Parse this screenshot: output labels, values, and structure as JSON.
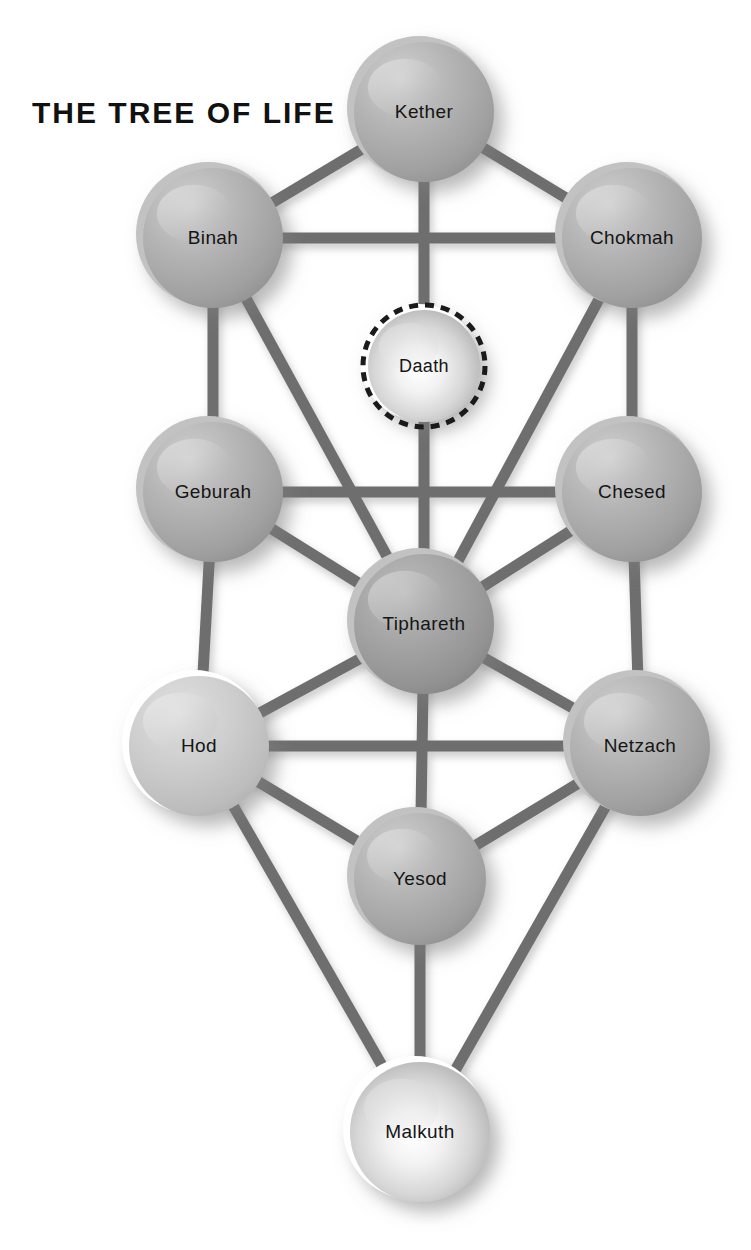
{
  "title": "THE TREE OF LIFE",
  "diagram": {
    "type": "node-link",
    "background": "#ffffff",
    "path_color": "#6e6e6e",
    "sphere_fill_mid": "#a9a9a9",
    "sphere_fill_light": "#d8d8d8",
    "sphere_fill_dark": "#8d8d8d",
    "label_color": "#151515",
    "daath_border_color": "#1a1a1a",
    "daath_border_style": "dashed",
    "nodes": [
      {
        "id": "kether",
        "label": "Kether",
        "cx": 424,
        "cy": 112,
        "r": 72,
        "tone": "mid",
        "dashed": false,
        "font": "normal"
      },
      {
        "id": "binah",
        "label": "Binah",
        "cx": 213,
        "cy": 238,
        "r": 72,
        "tone": "mid",
        "dashed": false,
        "font": "normal"
      },
      {
        "id": "chokmah",
        "label": "Chokmah",
        "cx": 632,
        "cy": 238,
        "r": 72,
        "tone": "mid",
        "dashed": false,
        "font": "normal"
      },
      {
        "id": "daath",
        "label": "Daath",
        "cx": 424,
        "cy": 366,
        "r": 58,
        "tone": "bright",
        "dashed": true,
        "font": "small"
      },
      {
        "id": "geburah",
        "label": "Geburah",
        "cx": 213,
        "cy": 492,
        "r": 72,
        "tone": "mid",
        "dashed": false,
        "font": "normal"
      },
      {
        "id": "chesed",
        "label": "Chesed",
        "cx": 632,
        "cy": 492,
        "r": 72,
        "tone": "mid",
        "dashed": false,
        "font": "normal"
      },
      {
        "id": "tiphareth",
        "label": "Tiphareth",
        "cx": 424,
        "cy": 624,
        "r": 72,
        "tone": "dark",
        "dashed": false,
        "font": "normal"
      },
      {
        "id": "hod",
        "label": "Hod",
        "cx": 199,
        "cy": 746,
        "r": 72,
        "tone": "light",
        "dashed": false,
        "font": "normal"
      },
      {
        "id": "netzach",
        "label": "Netzach",
        "cx": 640,
        "cy": 746,
        "r": 72,
        "tone": "mid",
        "dashed": false,
        "font": "normal"
      },
      {
        "id": "yesod",
        "label": "Yesod",
        "cx": 420,
        "cy": 879,
        "r": 68,
        "tone": "mid",
        "dashed": false,
        "font": "normal"
      },
      {
        "id": "malkuth",
        "label": "Malkuth",
        "cx": 420,
        "cy": 1132,
        "r": 72,
        "tone": "bright",
        "dashed": false,
        "font": "normal"
      }
    ],
    "paths": [
      {
        "from": "kether",
        "to": "binah"
      },
      {
        "from": "kether",
        "to": "chokmah"
      },
      {
        "from": "kether",
        "to": "daath"
      },
      {
        "from": "binah",
        "to": "chokmah"
      },
      {
        "from": "binah",
        "to": "geburah"
      },
      {
        "from": "chokmah",
        "to": "chesed"
      },
      {
        "from": "binah",
        "to": "tiphareth"
      },
      {
        "from": "chokmah",
        "to": "tiphareth"
      },
      {
        "from": "daath",
        "to": "tiphareth"
      },
      {
        "from": "geburah",
        "to": "chesed"
      },
      {
        "from": "geburah",
        "to": "tiphareth"
      },
      {
        "from": "chesed",
        "to": "tiphareth"
      },
      {
        "from": "geburah",
        "to": "hod"
      },
      {
        "from": "chesed",
        "to": "netzach"
      },
      {
        "from": "hod",
        "to": "tiphareth"
      },
      {
        "from": "netzach",
        "to": "tiphareth"
      },
      {
        "from": "hod",
        "to": "netzach"
      },
      {
        "from": "tiphareth",
        "to": "yesod"
      },
      {
        "from": "hod",
        "to": "yesod"
      },
      {
        "from": "netzach",
        "to": "yesod"
      },
      {
        "from": "hod",
        "to": "malkuth"
      },
      {
        "from": "netzach",
        "to": "malkuth"
      },
      {
        "from": "yesod",
        "to": "malkuth"
      }
    ]
  }
}
